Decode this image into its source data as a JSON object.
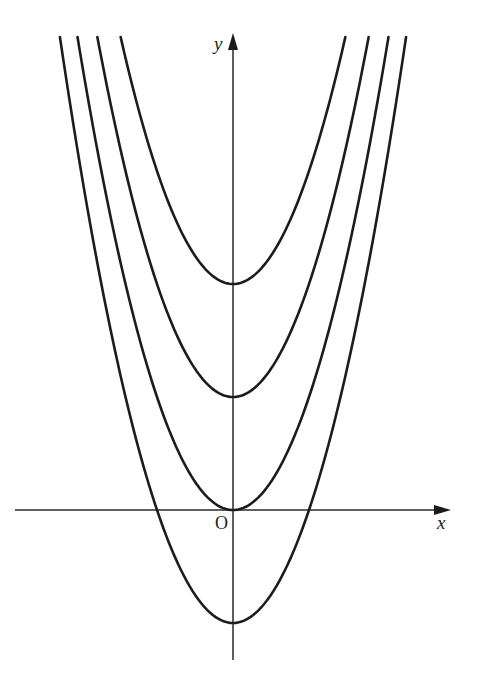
{
  "chart_data": {
    "type": "line",
    "title": "",
    "xlabel": "x",
    "ylabel": "y",
    "origin_label": "O",
    "grid": false,
    "legend": null,
    "function_form": "y = x^2 + c",
    "series": [
      {
        "name": "y = x^2 + 2",
        "c": 2,
        "vertex": [
          0,
          2
        ]
      },
      {
        "name": "y = x^2 + 1",
        "c": 1,
        "vertex": [
          0,
          1
        ]
      },
      {
        "name": "y = x^2",
        "c": 0,
        "vertex": [
          0,
          0
        ]
      },
      {
        "name": "y = x^2 - 1",
        "c": -1,
        "vertex": [
          0,
          -1
        ],
        "x_intercepts": [
          -1,
          1
        ]
      }
    ],
    "xlim": [
      -2.87,
      2.87
    ],
    "ylim": [
      -1.33,
      4.19
    ]
  },
  "layout": {
    "origin_px": [
      233,
      510
    ],
    "x_unit_px": 76,
    "y_unit_px": 113,
    "x_axis_px": [
      15,
      451
    ],
    "y_axis_px": [
      660,
      33
    ],
    "curve_top_px": 37,
    "colors": {
      "curve": "#1c1c1c",
      "axis": "#2a2a2a",
      "background": "#ffffff"
    }
  }
}
